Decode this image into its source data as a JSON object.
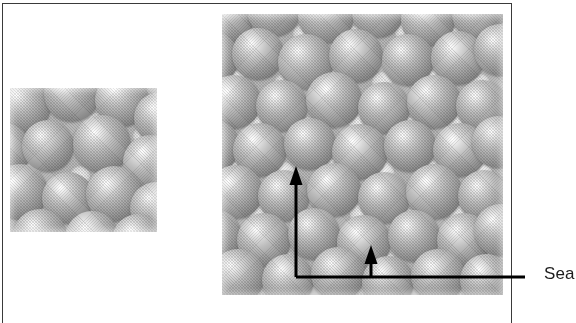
{
  "figure": {
    "frame": {
      "border_color": "#3a3a3a"
    },
    "panels": [
      {
        "name": "left-micrograph",
        "caption": "",
        "description": "grayscale micrograph of close-packed spheres, smaller magnification view",
        "x": 10,
        "y": 88,
        "width": 147,
        "height": 144,
        "sphere_diameter": 52,
        "spheres": [
          {
            "cx": 14,
            "cy": 18,
            "r": 27
          },
          {
            "cx": 62,
            "cy": 6,
            "r": 28
          },
          {
            "cx": 112,
            "cy": 12,
            "r": 27
          },
          {
            "cx": 150,
            "cy": 30,
            "r": 26
          },
          {
            "cx": -6,
            "cy": 62,
            "r": 27
          },
          {
            "cx": 38,
            "cy": 58,
            "r": 26
          },
          {
            "cx": 92,
            "cy": 56,
            "r": 29
          },
          {
            "cx": 140,
            "cy": 74,
            "r": 27
          },
          {
            "cx": 10,
            "cy": 104,
            "r": 28
          },
          {
            "cx": 58,
            "cy": 110,
            "r": 26
          },
          {
            "cx": 104,
            "cy": 106,
            "r": 28
          },
          {
            "cx": 146,
            "cy": 120,
            "r": 26
          },
          {
            "cx": 30,
            "cy": 148,
            "r": 27
          },
          {
            "cx": 82,
            "cy": 150,
            "r": 27
          },
          {
            "cx": 128,
            "cy": 152,
            "r": 26
          }
        ],
        "gaps": [
          {
            "cx": 88,
            "cy": 36,
            "r": 11
          },
          {
            "cx": 132,
            "cy": 48,
            "r": 9
          },
          {
            "cx": 20,
            "cy": 86,
            "r": 10
          },
          {
            "cx": 70,
            "cy": 88,
            "r": 10
          },
          {
            "cx": 120,
            "cy": 92,
            "r": 9
          },
          {
            "cx": 36,
            "cy": 128,
            "r": 9
          },
          {
            "cx": 90,
            "cy": 130,
            "r": 9
          }
        ]
      },
      {
        "name": "right-micrograph",
        "caption": "",
        "description": "grayscale micrograph of close-packed spheres, larger magnification view with annotation arrows",
        "x": 222,
        "y": 14,
        "width": 281,
        "height": 281,
        "sphere_diameter": 50,
        "spheres": [
          {
            "cx": 6,
            "cy": 4,
            "r": 26
          },
          {
            "cx": 52,
            "cy": -4,
            "r": 27
          },
          {
            "cx": 104,
            "cy": 2,
            "r": 28
          },
          {
            "cx": 156,
            "cy": -2,
            "r": 26
          },
          {
            "cx": 206,
            "cy": 6,
            "r": 27
          },
          {
            "cx": 256,
            "cy": 0,
            "r": 26
          },
          {
            "cx": -10,
            "cy": 44,
            "r": 27
          },
          {
            "cx": 36,
            "cy": 40,
            "r": 26
          },
          {
            "cx": 84,
            "cy": 48,
            "r": 28
          },
          {
            "cx": 134,
            "cy": 42,
            "r": 27
          },
          {
            "cx": 186,
            "cy": 46,
            "r": 26
          },
          {
            "cx": 236,
            "cy": 44,
            "r": 27
          },
          {
            "cx": 278,
            "cy": 36,
            "r": 26
          },
          {
            "cx": 12,
            "cy": 88,
            "r": 27
          },
          {
            "cx": 60,
            "cy": 92,
            "r": 26
          },
          {
            "cx": 112,
            "cy": 86,
            "r": 28
          },
          {
            "cx": 162,
            "cy": 94,
            "r": 26
          },
          {
            "cx": 212,
            "cy": 88,
            "r": 27
          },
          {
            "cx": 260,
            "cy": 92,
            "r": 26
          },
          {
            "cx": -8,
            "cy": 132,
            "r": 26
          },
          {
            "cx": 38,
            "cy": 136,
            "r": 27
          },
          {
            "cx": 88,
            "cy": 130,
            "r": 26
          },
          {
            "cx": 138,
            "cy": 138,
            "r": 28
          },
          {
            "cx": 188,
            "cy": 132,
            "r": 26
          },
          {
            "cx": 238,
            "cy": 136,
            "r": 27
          },
          {
            "cx": 276,
            "cy": 128,
            "r": 26
          },
          {
            "cx": 14,
            "cy": 178,
            "r": 27
          },
          {
            "cx": 62,
            "cy": 182,
            "r": 26
          },
          {
            "cx": 112,
            "cy": 176,
            "r": 27
          },
          {
            "cx": 162,
            "cy": 184,
            "r": 26
          },
          {
            "cx": 212,
            "cy": 178,
            "r": 28
          },
          {
            "cx": 262,
            "cy": 182,
            "r": 26
          },
          {
            "cx": -6,
            "cy": 222,
            "r": 26
          },
          {
            "cx": 42,
            "cy": 226,
            "r": 27
          },
          {
            "cx": 92,
            "cy": 220,
            "r": 26
          },
          {
            "cx": 142,
            "cy": 228,
            "r": 27
          },
          {
            "cx": 192,
            "cy": 222,
            "r": 26
          },
          {
            "cx": 242,
            "cy": 226,
            "r": 27
          },
          {
            "cx": 278,
            "cy": 216,
            "r": 26
          },
          {
            "cx": 16,
            "cy": 262,
            "r": 27
          },
          {
            "cx": 66,
            "cy": 266,
            "r": 26
          },
          {
            "cx": 116,
            "cy": 260,
            "r": 27
          },
          {
            "cx": 166,
            "cy": 268,
            "r": 26
          },
          {
            "cx": 216,
            "cy": 262,
            "r": 27
          },
          {
            "cx": 264,
            "cy": 266,
            "r": 26
          }
        ],
        "gaps": [
          {
            "cx": 30,
            "cy": 24,
            "r": 10
          },
          {
            "cx": 80,
            "cy": 20,
            "r": 9
          },
          {
            "cx": 132,
            "cy": 22,
            "r": 10
          },
          {
            "cx": 182,
            "cy": 18,
            "r": 9
          },
          {
            "cx": 234,
            "cy": 24,
            "r": 10
          },
          {
            "cx": 14,
            "cy": 66,
            "r": 9
          },
          {
            "cx": 62,
            "cy": 70,
            "r": 10
          },
          {
            "cx": 110,
            "cy": 64,
            "r": 9
          },
          {
            "cx": 160,
            "cy": 68,
            "r": 10
          },
          {
            "cx": 210,
            "cy": 66,
            "r": 9
          },
          {
            "cx": 258,
            "cy": 70,
            "r": 10
          },
          {
            "cx": 36,
            "cy": 110,
            "r": 10
          },
          {
            "cx": 86,
            "cy": 112,
            "r": 9
          },
          {
            "cx": 136,
            "cy": 108,
            "r": 10
          },
          {
            "cx": 186,
            "cy": 112,
            "r": 9
          },
          {
            "cx": 236,
            "cy": 110,
            "r": 10
          },
          {
            "cx": 12,
            "cy": 156,
            "r": 9
          },
          {
            "cx": 62,
            "cy": 158,
            "r": 10
          },
          {
            "cx": 112,
            "cy": 154,
            "r": 9
          },
          {
            "cx": 162,
            "cy": 158,
            "r": 10
          },
          {
            "cx": 212,
            "cy": 156,
            "r": 9
          },
          {
            "cx": 260,
            "cy": 158,
            "r": 10
          },
          {
            "cx": 38,
            "cy": 202,
            "r": 10
          },
          {
            "cx": 88,
            "cy": 204,
            "r": 9
          },
          {
            "cx": 138,
            "cy": 200,
            "r": 10
          },
          {
            "cx": 188,
            "cy": 204,
            "r": 9
          },
          {
            "cx": 238,
            "cy": 202,
            "r": 10
          },
          {
            "cx": 14,
            "cy": 246,
            "r": 9
          },
          {
            "cx": 64,
            "cy": 248,
            "r": 10
          },
          {
            "cx": 114,
            "cy": 244,
            "r": 9
          },
          {
            "cx": 164,
            "cy": 248,
            "r": 10
          },
          {
            "cx": 214,
            "cy": 246,
            "r": 9
          },
          {
            "cx": 262,
            "cy": 248,
            "r": 10
          }
        ]
      }
    ],
    "annotations": {
      "line_color": "#000000",
      "stroke_width": 3,
      "leader_line": {
        "x1": 296,
        "y1": 277,
        "x2": 525,
        "y2": 277
      },
      "arrows": [
        {
          "name": "tall-arrow",
          "x": 296,
          "tip_y": 166,
          "base_y": 277,
          "head_width": 13,
          "head_height": 19
        },
        {
          "name": "short-arrow",
          "x": 371,
          "tip_y": 245,
          "base_y": 277,
          "head_width": 13,
          "head_height": 19
        }
      ]
    },
    "label": {
      "name": "annotation-label",
      "text": "Sea",
      "truncated": true,
      "color": "#1d1d1d",
      "x": 544,
      "y": 264
    }
  }
}
